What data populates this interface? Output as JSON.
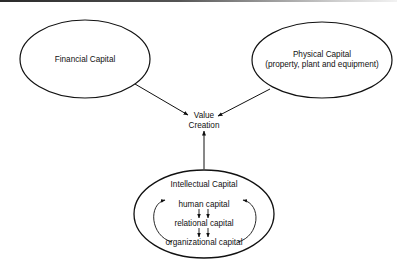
{
  "diagram": {
    "nodes": {
      "financial": {
        "label": "Financial Capital"
      },
      "physical": {
        "line1": "Physical Capital",
        "line2": "(property, plant and equipment)"
      },
      "value": {
        "line1": "Value",
        "line2": "Creation"
      },
      "intellectual": {
        "title": "Intellectual Capital",
        "components": [
          "human capital",
          "relational capital",
          "organizational capital"
        ]
      }
    },
    "edges": [
      {
        "from": "Financial Capital",
        "to": "Value Creation"
      },
      {
        "from": "Physical Capital",
        "to": "Value Creation"
      },
      {
        "from": "Intellectual Capital",
        "to": "Value Creation"
      },
      {
        "from": "human capital",
        "to": "relational capital"
      },
      {
        "from": "relational capital",
        "to": "organizational capital"
      },
      {
        "from": "organizational capital",
        "to": "human capital",
        "style": "curved-loop-both-sides"
      }
    ],
    "colors": {
      "stroke": "#111111",
      "background": "#ffffff"
    }
  }
}
